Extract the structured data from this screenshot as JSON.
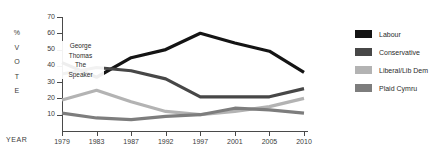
{
  "axis": {
    "y_title_chars": [
      "%",
      "V",
      "O",
      "T",
      "E"
    ],
    "x_title": "YEAR",
    "y_ticks": [
      70,
      60,
      50,
      40,
      30,
      20,
      10
    ],
    "x_ticks": [
      "1979",
      "1983",
      "1987",
      "1992",
      "1997",
      "2001",
      "2005",
      "2010"
    ]
  },
  "annotation": {
    "lines": [
      "George",
      "Thomas",
      "The",
      "Speaker"
    ]
  },
  "legend": {
    "items": [
      {
        "label": "Labour",
        "color": "#141414"
      },
      {
        "label": "Conservative",
        "color": "#474747"
      },
      {
        "label": "Liberal/Lib Dem",
        "color": "#b3b3b3"
      },
      {
        "label": "Plaid Cymru",
        "color": "#7d7d7d"
      }
    ]
  },
  "chart_data": {
    "type": "line",
    "title": "",
    "xlabel": "YEAR",
    "ylabel": "% VOTE",
    "categories": [
      "1979",
      "1983",
      "1987",
      "1992",
      "1997",
      "2001",
      "2005",
      "2010"
    ],
    "ylim": [
      0,
      70
    ],
    "ytick_step": 10,
    "grid": false,
    "legend_position": "right",
    "annotations": [
      {
        "text": "George Thomas The Speaker",
        "near_x": "1979",
        "near_y": 36
      }
    ],
    "series": [
      {
        "name": "Labour",
        "color": "#141414",
        "values": [
          42,
          33,
          45,
          50,
          60,
          54,
          49,
          36
        ]
      },
      {
        "name": "Conservative",
        "color": "#474747",
        "values": [
          35,
          39,
          37,
          32,
          21,
          21,
          21,
          26
        ]
      },
      {
        "name": "Liberal/Lib Dem",
        "color": "#b3b3b3",
        "values": [
          19,
          25,
          18,
          12,
          10,
          12,
          15,
          20
        ]
      },
      {
        "name": "Plaid Cymru",
        "color": "#7d7d7d",
        "values": [
          11,
          8,
          7,
          9,
          10,
          14,
          13,
          11
        ]
      }
    ]
  }
}
